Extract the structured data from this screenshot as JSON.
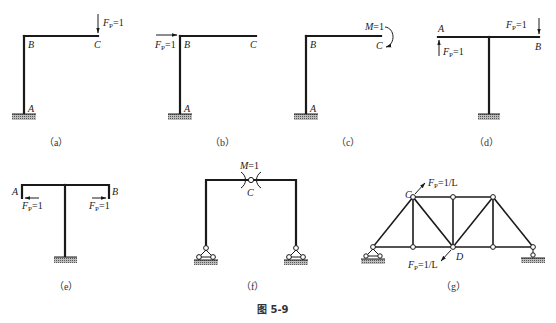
{
  "figure": {
    "caption": "图 5-9",
    "panels": [
      {
        "id": "a",
        "caption": "（a）",
        "structure": "L-shaped cantilever frame, fixed at A",
        "nodes": {
          "A": "A",
          "B": "B",
          "C": "C"
        },
        "load": {
          "label": "F",
          "sub": "P",
          "value": "=1",
          "type": "vertical force downward at C"
        }
      },
      {
        "id": "b",
        "caption": "（b）",
        "structure": "L-shaped cantilever frame, fixed at A",
        "nodes": {
          "A": "A",
          "B": "B",
          "C": "C"
        },
        "load": {
          "label": "F",
          "sub": "P",
          "value": "=1",
          "type": "horizontal force rightward at B"
        }
      },
      {
        "id": "c",
        "caption": "（c）",
        "structure": "L-shaped cantilever frame, fixed at A",
        "nodes": {
          "A": "A",
          "B": "B",
          "C": "C"
        },
        "load": {
          "label": "M",
          "value": "=1",
          "type": "clockwise moment at C"
        }
      },
      {
        "id": "d",
        "caption": "（d）",
        "structure": "T-shaped frame, fixed base",
        "nodes": {
          "A": "A",
          "B": "B"
        },
        "loads": [
          {
            "label": "F",
            "sub": "P",
            "value": "=1",
            "type": "upward force at A"
          },
          {
            "label": "F",
            "sub": "P",
            "value": "=1",
            "type": "downward force at B"
          }
        ]
      },
      {
        "id": "e",
        "caption": "（e）",
        "structure": "T-shaped frame with downturned ends, fixed base",
        "nodes": {
          "A": "A",
          "B": "B"
        },
        "loads": [
          {
            "label": "F",
            "sub": "P",
            "value": "=1",
            "type": "leftward force at A"
          },
          {
            "label": "F",
            "sub": "P",
            "value": "=1",
            "type": "rightward force at B"
          }
        ]
      },
      {
        "id": "f",
        "caption": "（f）",
        "structure": "Three-hinged portal frame with pinned supports",
        "nodes": {
          "C": "C"
        },
        "load": {
          "label": "M",
          "value": "=1",
          "type": "pair of equal and opposite unit moments at hinge C"
        }
      },
      {
        "id": "g",
        "caption": "（g）",
        "structure": "Simply supported truss",
        "nodes": {
          "C": "C",
          "D": "D"
        },
        "loads": [
          {
            "label": "F",
            "sub": "P",
            "value": "=1/L",
            "type": "force at C directed along CD (outward)"
          },
          {
            "label": "F",
            "sub": "P",
            "value": "=1/L",
            "type": "force at D directed along CD (outward)"
          }
        ]
      }
    ]
  }
}
